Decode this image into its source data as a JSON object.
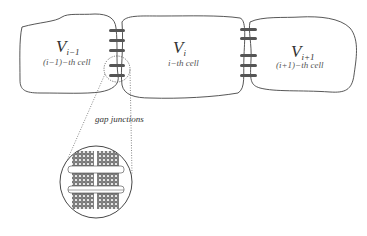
{
  "diagram": {
    "cells": [
      {
        "id": "cell-left",
        "voltage": "V",
        "subscript": "i−1",
        "caption": "(i−1)−th cell"
      },
      {
        "id": "cell-middle",
        "voltage": "V",
        "subscript": "i",
        "caption": "i−th cell"
      },
      {
        "id": "cell-right",
        "voltage": "V",
        "subscript": "i+1",
        "caption": "(i+1)−th cell"
      }
    ],
    "inset_label": "gap junctions",
    "colors": {
      "outline": "#444444",
      "junction": "#555555",
      "background": "#ffffff"
    }
  }
}
